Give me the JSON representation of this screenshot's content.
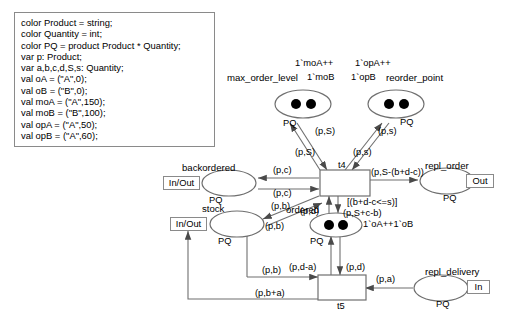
{
  "diagram": {
    "declaration": {
      "lines": [
        "color Product = string;",
        "color Quantity = int;",
        "color PQ = product Product * Quantity;",
        "var p: Product;",
        "var a,b,c,d,S,s: Quantity;",
        "val oA = (\"A\",0);",
        "val oB = (\"B\",0);",
        "val moA = (\"A\",150);",
        "val moB = (\"B\",100);",
        "val opA = (\"A\",50);",
        "val opB = (\"A\",60);"
      ]
    },
    "places": [
      {
        "id": "max_order_level",
        "name": "max_order_level",
        "colorset": "PQ",
        "tokens": 2,
        "marking": "1`moA++ 1`moB",
        "port": null
      },
      {
        "id": "reorder_point",
        "name": "reorder_point",
        "colorset": "PQ",
        "tokens": 2,
        "marking": "1`opA++ 1`opB",
        "port": null
      },
      {
        "id": "backordered",
        "name": "backordered",
        "colorset": "PQ",
        "tokens": 0,
        "marking": "",
        "port": "In/Out"
      },
      {
        "id": "stock",
        "name": "stock",
        "colorset": "PQ",
        "tokens": 0,
        "marking": "",
        "port": "In/Out"
      },
      {
        "id": "repl_order",
        "name": "repl_order",
        "colorset": "PQ",
        "tokens": 0,
        "marking": "",
        "port": "Out"
      },
      {
        "id": "ordered",
        "name": "ordered",
        "colorset": "PQ",
        "tokens": 2,
        "marking": "1`oA++1`oB",
        "port": null
      },
      {
        "id": "repl_delivery",
        "name": "repl_delivery",
        "colorset": "PQ",
        "tokens": 0,
        "marking": "",
        "port": "In"
      }
    ],
    "transitions": [
      {
        "id": "t4",
        "name": "t4",
        "guard": "[(b+d-c<=s)]"
      },
      {
        "id": "t5",
        "name": "t5",
        "guard": ""
      }
    ],
    "arcs": [
      {
        "id": "a1",
        "from": "max_order_level",
        "to": "t4",
        "label": "(p,S)"
      },
      {
        "id": "a2",
        "from": "max_order_level",
        "to": "t4",
        "label": "(p,S)"
      },
      {
        "id": "a3",
        "from": "reorder_point",
        "to": "t4",
        "label": "(p,s)"
      },
      {
        "id": "a4",
        "from": "reorder_point",
        "to": "t4",
        "label": "(p,s)"
      },
      {
        "id": "a5",
        "from": "t4",
        "to": "backordered",
        "label": "(p,c)"
      },
      {
        "id": "a6",
        "from": "backordered",
        "to": "t4",
        "label": "(p,c)"
      },
      {
        "id": "a7",
        "from": "stock",
        "to": "t4",
        "label": "(p,b)"
      },
      {
        "id": "a8",
        "from": "t4",
        "to": "stock",
        "label": "(p,b)"
      },
      {
        "id": "a9",
        "from": "t4",
        "to": "repl_order",
        "label": "(p,S-(b+d-c))"
      },
      {
        "id": "a10",
        "from": "ordered",
        "to": "t4",
        "label": "(p,d)"
      },
      {
        "id": "a11",
        "from": "t4",
        "to": "ordered",
        "label": "(p,S+c-b)"
      },
      {
        "id": "a12",
        "from": "ordered",
        "to": "t5",
        "label": "(p,d)"
      },
      {
        "id": "a13",
        "from": "t5",
        "to": "ordered",
        "label": "(p,d-a)"
      },
      {
        "id": "a14",
        "from": "repl_delivery",
        "to": "t5",
        "label": "(p,a)"
      },
      {
        "id": "a15",
        "from": "stock",
        "to": "t5",
        "label": "(p,b)"
      },
      {
        "id": "a16",
        "from": "t5",
        "to": "stock",
        "label": "(p,b+a)"
      }
    ],
    "colors": {
      "stroke": "#6f6f6f",
      "text": "#000000",
      "token": "#000000",
      "background": "#ffffff"
    }
  }
}
